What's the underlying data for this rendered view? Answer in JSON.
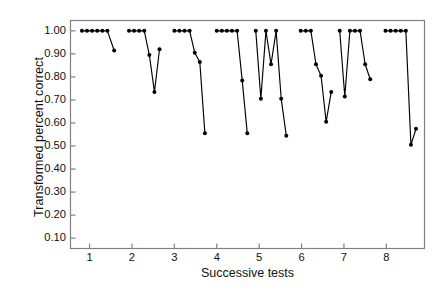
{
  "chart_data": {
    "type": "line",
    "title": "",
    "xlabel": "Successive tests",
    "ylabel": "Transformed percent correct",
    "xlim": [
      0.55,
      8.9
    ],
    "ylim": [
      0.055,
      1.045
    ],
    "xticks": [
      1,
      2,
      3,
      4,
      5,
      6,
      7,
      8
    ],
    "xtick_labels": [
      "1",
      "2",
      "3",
      "4",
      "5",
      "6",
      "7",
      "8"
    ],
    "yticks": [
      0.1,
      0.2,
      0.3,
      0.4,
      0.5,
      0.6,
      0.7,
      0.8,
      0.9,
      1.0
    ],
    "ytick_labels": [
      "0.10",
      "0.20",
      "0.30",
      "0.40",
      "0.50",
      "0.60",
      "0.70",
      "0.80",
      "0.90",
      "1.00"
    ],
    "grid": false,
    "legend": false,
    "marker": "filled-circle",
    "marker_color": "#000000",
    "line_color": "#000000",
    "frame_color": "#808080",
    "series": [
      {
        "name": "block-1",
        "x": [
          0.82,
          0.94,
          1.06,
          1.18,
          1.3,
          1.42,
          1.58
        ],
        "y": [
          1.0,
          1.0,
          1.0,
          1.0,
          1.0,
          1.0,
          0.915
        ]
      },
      {
        "name": "block-2",
        "x": [
          1.93,
          2.05,
          2.17,
          2.29,
          2.41,
          2.53,
          2.65
        ],
        "y": [
          1.0,
          1.0,
          1.0,
          1.0,
          0.895,
          0.735,
          0.92
        ]
      },
      {
        "name": "block-3",
        "x": [
          3.0,
          3.12,
          3.24,
          3.36,
          3.48,
          3.6,
          3.72
        ],
        "y": [
          1.0,
          1.0,
          1.0,
          1.0,
          0.905,
          0.865,
          0.555
        ]
      },
      {
        "name": "block-4",
        "x": [
          4.0,
          4.12,
          4.24,
          4.36,
          4.48,
          4.6,
          4.72
        ],
        "y": [
          1.0,
          1.0,
          1.0,
          1.0,
          1.0,
          0.785,
          0.555
        ]
      },
      {
        "name": "block-5",
        "x": [
          4.92,
          5.04,
          5.16,
          5.28,
          5.4,
          5.52,
          5.64
        ],
        "y": [
          1.0,
          0.705,
          1.0,
          0.855,
          1.0,
          0.705,
          0.545
        ]
      },
      {
        "name": "block-6",
        "x": [
          5.98,
          6.1,
          6.22,
          6.34,
          6.46,
          6.58,
          6.7
        ],
        "y": [
          1.0,
          1.0,
          1.0,
          0.855,
          0.805,
          0.605,
          0.735
        ]
      },
      {
        "name": "block-7",
        "x": [
          6.9,
          7.02,
          7.14,
          7.26,
          7.38,
          7.5,
          7.62
        ],
        "y": [
          1.0,
          0.715,
          1.0,
          1.0,
          1.0,
          0.855,
          0.79
        ]
      },
      {
        "name": "block-8",
        "x": [
          7.98,
          8.1,
          8.22,
          8.34,
          8.46,
          8.58,
          8.7
        ],
        "y": [
          1.0,
          1.0,
          1.0,
          1.0,
          1.0,
          0.505,
          0.575
        ]
      }
    ]
  }
}
